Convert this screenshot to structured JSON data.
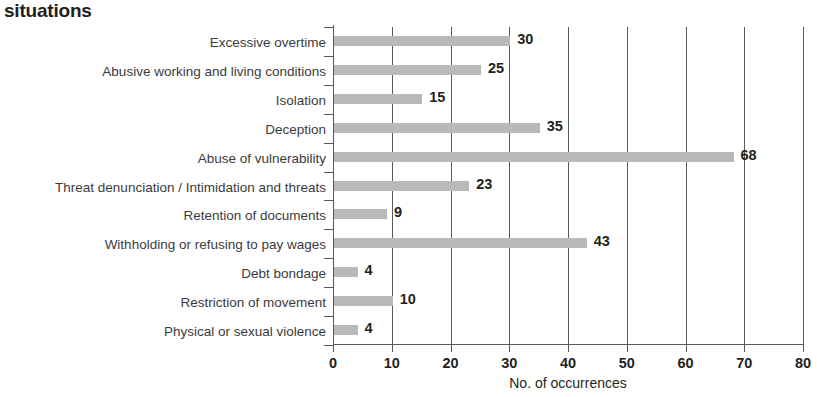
{
  "chart_data": {
    "type": "bar",
    "orientation": "horizontal",
    "title": "situations",
    "xlabel": "No. of occurrences",
    "ylabel": "",
    "xlim": [
      0,
      80
    ],
    "xticks": [
      0,
      10,
      20,
      30,
      40,
      50,
      60,
      70,
      80
    ],
    "xtick_labels": [
      "0",
      "10",
      "20",
      "30",
      "40",
      "50",
      "60",
      "70",
      "80"
    ],
    "grid": true,
    "grid_axis": "x",
    "legend": false,
    "bar_color": "#b9b9b9",
    "axis_color": "#58595b",
    "label_color": "#3b3b3d",
    "value_color": "#231f20",
    "categories": [
      "Excessive overtime",
      "Abusive working and living conditions",
      "Isolation",
      "Deception",
      "Abuse of vulnerability",
      "Threat denunciation / Intimidation and threats",
      "Retention of documents",
      "Withholding or refusing to pay wages",
      "Debt bondage",
      "Restriction of movement",
      "Physical or sexual violence"
    ],
    "values": [
      30,
      25,
      15,
      35,
      68,
      23,
      9,
      43,
      4,
      10,
      4
    ],
    "value_labels": [
      "30",
      "25",
      "15",
      "35",
      "68",
      "23",
      "9",
      "43",
      "4",
      "10",
      "4"
    ]
  }
}
